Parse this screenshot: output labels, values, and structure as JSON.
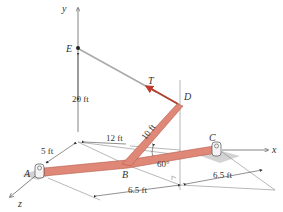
{
  "diagram": {
    "type": "3D statics free-body setup",
    "axes": {
      "x": "x",
      "y": "y",
      "z": "z"
    },
    "points": {
      "A": "A",
      "B": "B",
      "C": "C",
      "D": "D",
      "E": "E"
    },
    "force": {
      "label": "T",
      "color": "#c0392b"
    },
    "dimensions": {
      "height_E": "20 ft",
      "z_offset": "5 ft",
      "x_to_B": "12 ft",
      "rod_BD": "10 ft",
      "angle": "60°",
      "AB_to_foot": "6.5 ft",
      "foot_to_C": "6.5 ft"
    },
    "colors": {
      "rod": "#e08878",
      "rod_edge": "#b55a4a",
      "cable": "#999999",
      "lines": "#555555",
      "ground_shadow": "#c8c8c8"
    }
  }
}
